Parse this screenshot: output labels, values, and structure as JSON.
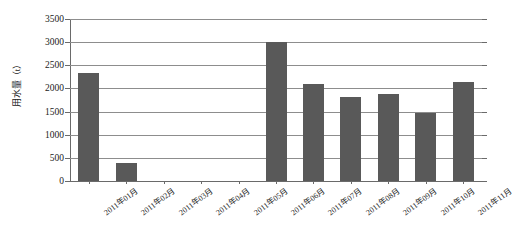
{
  "chart_data": {
    "type": "bar",
    "title": "",
    "subtitle": "",
    "xlabel": "",
    "ylabel": "用水量（t）",
    "ylim": [
      0,
      3500
    ],
    "ytick_step": 500,
    "yticks": [
      "0",
      "500",
      "1000",
      "1500",
      "2000",
      "2500",
      "3000",
      "3500"
    ],
    "grid": true,
    "legend": "none",
    "bar_color": "#595959",
    "gridline_color": "#8d8d8d",
    "axis_color": "#6a6a6a",
    "categories": [
      "2011年01月",
      "2011年02月",
      "2011年03月",
      "2011年04月",
      "2011年05月",
      "2011年06月",
      "2011年07月",
      "2011年08月",
      "2011年09月",
      "2011年10月",
      "2011年11月"
    ],
    "values": [
      2330,
      380,
      0,
      0,
      0,
      3000,
      2100,
      1810,
      1870,
      1480,
      2150
    ]
  }
}
